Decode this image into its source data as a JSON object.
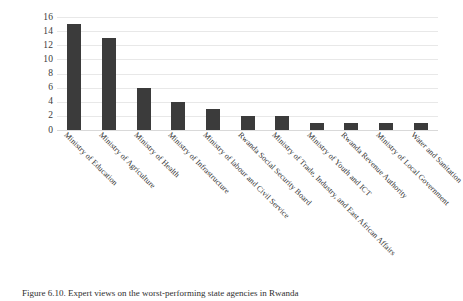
{
  "figure": {
    "caption": "Figure 6.10. Expert views on the worst-performing state agencies in Rwanda"
  },
  "chart_data": {
    "type": "bar",
    "title": "",
    "xlabel": "",
    "ylabel": "",
    "ylim": [
      0,
      16
    ],
    "ytick_step": 2,
    "grid": true,
    "legend": false,
    "bar_color": "#3b3b3b",
    "gridline_color": "#e8e8e8",
    "ticks": [
      "0",
      "2",
      "4",
      "6",
      "8",
      "10",
      "12",
      "14",
      "16"
    ],
    "categories": [
      "Ministry of Education",
      "Ministry of Agriculture",
      "Ministry of Health",
      "Ministry of Infrastructure",
      "Ministry of labour and Civil Service",
      "Rwanda Social Security Board",
      "Ministry of Trade, Industry, and East African Affairs",
      "Ministry of Youth and ICT",
      "Rwanda Revenue Authority",
      "Ministry of Local Government",
      "Water and Sanitation"
    ],
    "values": [
      15,
      13,
      6,
      4,
      3,
      2,
      2,
      1,
      1,
      1,
      1
    ]
  }
}
